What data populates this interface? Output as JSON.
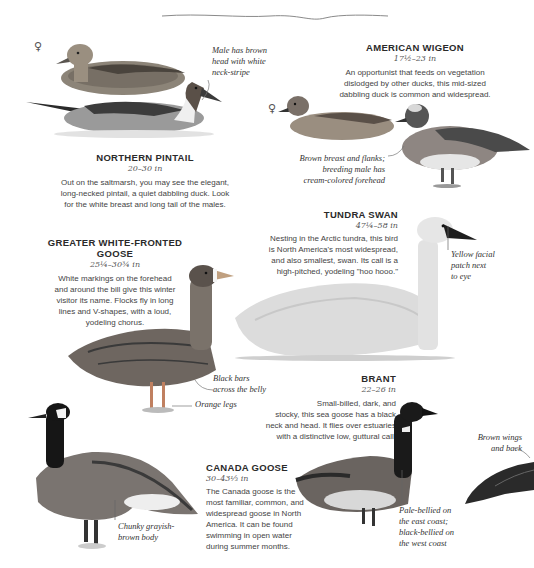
{
  "page": {
    "divider": "hand-drawn-wavy-line",
    "female_symbol": "♀"
  },
  "species": [
    {
      "id": "northern-pintail",
      "name": "NORTHERN PINTAIL",
      "size": "20–30 in",
      "description_lines": [
        "Out on the saltmarsh, you may see the elegant,",
        "long-necked pintail, a quiet dabbling duck. Look",
        "for the white breast and long tail of the males."
      ],
      "notes": [
        "Male has brown head with white neck-stripe"
      ]
    },
    {
      "id": "american-wigeon",
      "name": "AMERICAN WIGEON",
      "size": "17½–23 in",
      "description_lines": [
        "An opportunist that feeds on vegetation",
        "dislodged by other ducks, this mid-sized",
        "dabbling duck is common and widespread."
      ],
      "notes": [
        "Brown breast and flanks; breeding male has cream-colored forehead"
      ]
    },
    {
      "id": "tundra-swan",
      "name": "TUNDRA SWAN",
      "size": "47¼–58 in",
      "description_lines": [
        "Nesting in the Arctic tundra, this bird",
        "is North America's most widespread,",
        "and  also smallest, swan. Its call is a",
        "high-pitched, yodeling \"hoo hooo.\""
      ],
      "notes": [
        "Yellow facial patch next to eye"
      ]
    },
    {
      "id": "greater-white-fronted-goose",
      "name_lines": [
        "GREATER WHITE-FRONTED",
        "GOOSE"
      ],
      "size": "25¼–30¾ in",
      "description_lines": [
        "White markings on the forehead",
        "and around the bill give this winter",
        "visitor its name. Flocks fly in long",
        "lines and V-shapes, with a loud,",
        "yodeling chorus."
      ],
      "notes": [
        "Black bars across the belly",
        "Orange legs"
      ]
    },
    {
      "id": "brant",
      "name": "BRANT",
      "size": "22–26 in",
      "description_lines": [
        "Small-billed, dark, and",
        "stocky, this sea goose has a black",
        "neck and head. It flies over estuaries",
        "with a distinctive low, guttural call."
      ],
      "notes": [
        "Pale-bellied on the east coast; black-bellied on the west coast",
        "Brown wings and back"
      ]
    },
    {
      "id": "canada-goose",
      "name": "CANADA GOOSE",
      "size": "30–43⅓ in",
      "description_lines": [
        "The Canada goose is the",
        "most familiar, common, and",
        "widespread goose in North",
        "America. It can be found",
        "swimming in open water",
        "during summer months."
      ],
      "notes": [
        "Chunky grayish-brown body"
      ]
    }
  ],
  "annotations": {
    "pintail_male": [
      "Male has brown",
      "head with white",
      "neck-stripe"
    ],
    "wigeon": [
      "Brown breast and flanks;",
      "breeding male has",
      "cream-colored forehead"
    ],
    "swan": [
      "Yellow facial",
      "patch next",
      "to eye"
    ],
    "gwf_belly": [
      "Black bars",
      "across the belly"
    ],
    "gwf_legs": "Orange legs",
    "brant_belly": [
      "Pale-bellied on",
      "the east coast;",
      "black-bellied on",
      "the west coast"
    ],
    "brant_wings": [
      "Brown wings",
      "and back"
    ],
    "canada_body": [
      "Chunky grayish-",
      "brown body"
    ]
  }
}
